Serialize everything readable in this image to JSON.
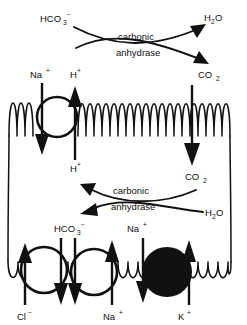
{
  "diagram": {
    "colors": {
      "ink": "#111111",
      "background": "#ffffff",
      "pump_fill": "#111111",
      "carrier_fill": "#ffffff"
    },
    "compartments": {
      "lumen_label": "",
      "cell_label": "",
      "blood_label": ""
    },
    "labels": {
      "luminal_bicarbonate": "HCO",
      "luminal_bicarbonate_sub": "3",
      "luminal_bicarbonate_sup": "−",
      "water_top": "H",
      "water_top_sub": "2",
      "water_top_rest": "O",
      "co2_top": "CO",
      "co2_top_sub": "2",
      "sodium_lumen": "Na",
      "sodium_lumen_sup": "+",
      "proton_lumen": "H",
      "proton_lumen_sup": "+",
      "proton_cell": "H",
      "proton_cell_sup": "+",
      "co2_cell": "CO",
      "co2_cell_sub": "2",
      "water_cell": "H",
      "water_cell_sub": "2",
      "water_cell_rest": "O",
      "bicarbonate_cell": "HCO",
      "bicarbonate_cell_sub": "3",
      "bicarbonate_cell_sup": "−",
      "sodium_cell": "Na",
      "sodium_cell_sup": "+",
      "chloride_blood": "Cl",
      "chloride_blood_sup": "−",
      "sodium_blood": "Na",
      "sodium_blood_sup": "+",
      "potassium_blood": "K",
      "potassium_blood_sup": "+"
    },
    "enzymes": {
      "top_line1": "carbonic",
      "top_line2": "anhydrase",
      "bottom_line1": "carbonic",
      "bottom_line2": "anhydrase"
    },
    "transporters": [
      {
        "name": "apical-sodium-hydrogen-exchanger",
        "kind": "circle",
        "filled": false
      },
      {
        "name": "basolateral-chloride-bicarbonate-exchanger",
        "kind": "circle",
        "filled": false
      },
      {
        "name": "basolateral-sodium-bicarbonate-cotransporter",
        "kind": "circle",
        "filled": false
      },
      {
        "name": "sodium-potassium-atpase-pump",
        "kind": "circle",
        "filled": true
      }
    ],
    "reactions": {
      "apical": {
        "substrates": [
          "HCO3-",
          "H+"
        ],
        "products": [
          "H2O",
          "CO2"
        ],
        "enzyme": "carbonic anhydrase"
      },
      "intracellular": {
        "substrates": [
          "CO2",
          "H2O"
        ],
        "products": [
          "H+",
          "HCO3-"
        ],
        "enzyme": "carbonic anhydrase"
      }
    }
  }
}
